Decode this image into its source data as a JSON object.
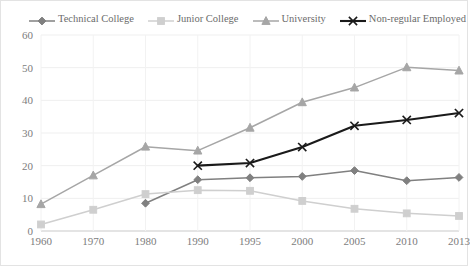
{
  "chart_data": {
    "type": "line",
    "title": "",
    "subtitle": "",
    "xlabel": "",
    "ylabel": "",
    "categories": [
      "1960",
      "1970",
      "1980",
      "1990",
      "1995",
      "2000",
      "2005",
      "2010",
      "2013"
    ],
    "ylim": [
      0,
      60
    ],
    "ytick_values": [
      0,
      10,
      20,
      30,
      40,
      50,
      60
    ],
    "ytick_labels": [
      "0",
      "10",
      "20",
      "30",
      "40",
      "50",
      "60"
    ],
    "grid": "horizontal-light-vertical-light",
    "legend_position": "top",
    "series": [
      {
        "name": "Technical College",
        "marker": "diamond",
        "color": "#808080",
        "values": [
          null,
          null,
          8.5,
          15.7,
          16.3,
          16.7,
          18.5,
          15.4,
          16.4
        ]
      },
      {
        "name": "Junior College",
        "marker": "square",
        "color": "#cfcfcf",
        "values": [
          2.0,
          6.5,
          11.3,
          12.5,
          12.3,
          9.2,
          6.8,
          5.4,
          4.6
        ]
      },
      {
        "name": "University",
        "marker": "triangle",
        "color": "#a6a6a6",
        "values": [
          8.2,
          17.0,
          25.8,
          24.6,
          31.6,
          39.4,
          43.9,
          50.1,
          49.1
        ]
      },
      {
        "name": "Non-regular Employed",
        "marker": "cross",
        "color": "#1a1a1a",
        "values": [
          null,
          null,
          null,
          20.0,
          20.8,
          25.7,
          32.2,
          34.0,
          36.1
        ]
      }
    ]
  },
  "legend": {
    "items": [
      {
        "label": "Technical College",
        "marker": "diamond-marker-icon"
      },
      {
        "label": "Junior College",
        "marker": "square-marker-icon"
      },
      {
        "label": "University",
        "marker": "triangle-marker-icon"
      },
      {
        "label": "Non-regular Employed",
        "marker": "cross-marker-icon"
      }
    ]
  }
}
